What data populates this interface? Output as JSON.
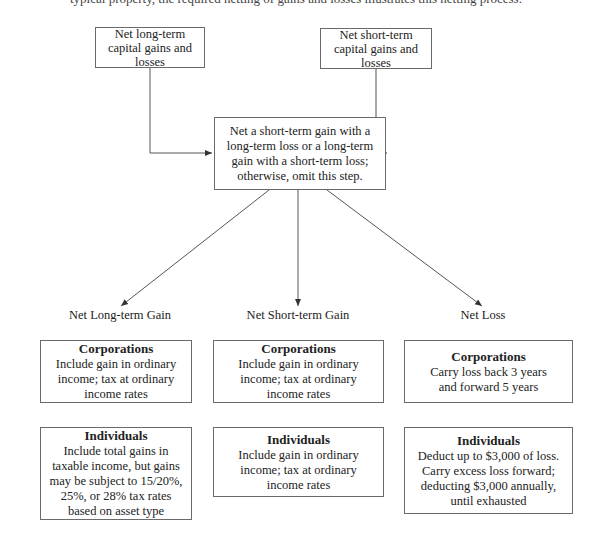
{
  "caption": "typical property, the required netting of gains and losses illustrates this netting process.",
  "top": {
    "long_term": "Net long-term capital gains and losses",
    "short_term": "Net short-term capital gains and losses"
  },
  "center": "Net a short-term gain with a long-term loss or a long-term gain with a short-term loss; otherwise, omit this step.",
  "outcomes": [
    {
      "label": "Net Long-term Gain",
      "corporations": {
        "title": "Corporations",
        "text": "Include gain in ordinary income; tax at ordinary income rates"
      },
      "individuals": {
        "title": "Individuals",
        "text": "Include total gains in taxable income, but gains may be subject to 15/20%, 25%, or 28% tax rates based on asset type"
      }
    },
    {
      "label": "Net Short-term Gain",
      "corporations": {
        "title": "Corporations",
        "text": "Include gain in ordinary income; tax at ordinary income rates"
      },
      "individuals": {
        "title": "Individuals",
        "text": "Include gain in ordinary income; tax at ordinary income rates"
      }
    },
    {
      "label": "Net Loss",
      "corporations": {
        "title": "Corporations",
        "text": "Carry loss back 3 years and forward 5 years"
      },
      "individuals": {
        "title": "Individuals",
        "text": "Deduct up to $3,000 of loss. Carry excess loss forward; deducting $3,000 annually, until exhausted"
      }
    }
  ],
  "colors": {
    "line": "#555555",
    "border": "#6a6a6a",
    "text": "#222222"
  }
}
